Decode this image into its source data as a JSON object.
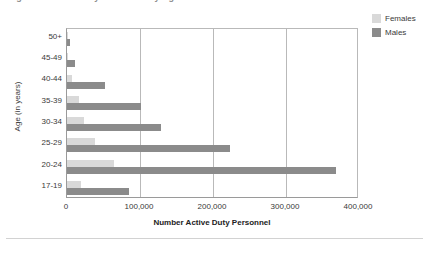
{
  "title": {
    "text": "Figure 1. Active Duty Personnel by Age and Gender",
    "truncated": true
  },
  "legend": {
    "position": "top-right",
    "items": [
      {
        "label": "Females",
        "color": "#d9d9d9",
        "swatch_name": "legend-swatch-females"
      },
      {
        "label": "Males",
        "color": "#8b8b8b",
        "swatch_name": "legend-swatch-males"
      }
    ]
  },
  "axes": {
    "x_title": "Number Active Duty Personnel",
    "y_title": "Age (in years)",
    "x_ticks": [
      "0",
      "100,000",
      "200,000",
      "300,000",
      "400,000"
    ],
    "x_tick_values": [
      0,
      100000,
      200000,
      300000,
      400000
    ]
  },
  "chart_data": {
    "type": "bar",
    "orientation": "horizontal",
    "title": "Figure 1. Active Duty Personnel by Age and Gender",
    "xlabel": "Number Active Duty Personnel",
    "ylabel": "Age (in years)",
    "xlim": [
      0,
      400000
    ],
    "xticks": [
      0,
      100000,
      200000,
      300000,
      400000
    ],
    "xticklabels": [
      "0",
      "100,000",
      "200,000",
      "300,000",
      "400,000"
    ],
    "grid": "vertical",
    "legend_position": "top-right",
    "categories": [
      "50+",
      "45-49",
      "40-44",
      "35-39",
      "30-34",
      "25-29",
      "20-24",
      "17-19"
    ],
    "series": [
      {
        "name": "Females",
        "color": "#d9d9d9",
        "values": [
          900,
          2000,
          7500,
          17000,
          23000,
          38000,
          65000,
          19000
        ]
      },
      {
        "name": "Males",
        "color": "#8b8b8b",
        "values": [
          4000,
          11000,
          52000,
          101000,
          129000,
          223000,
          368000,
          85000
        ]
      }
    ]
  }
}
